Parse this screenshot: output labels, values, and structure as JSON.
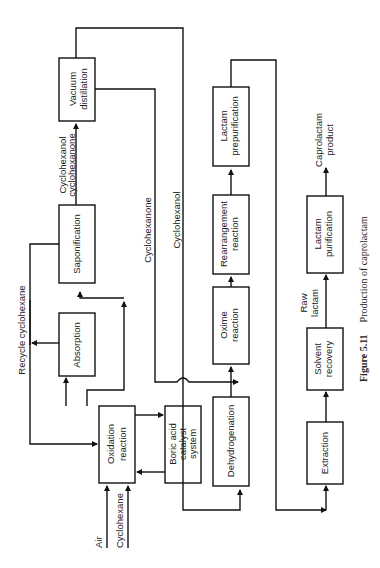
{
  "figure": {
    "number": "Figure 5.11",
    "caption": "Production of caprolactam",
    "orientation": "rotated 90° counter-clockwise"
  },
  "inputs": {
    "air": "Air",
    "cyclohexane": "Cyclohexane"
  },
  "blocks": {
    "oxidation": [
      "Oxidation",
      "reaction"
    ],
    "boric": [
      "Boric acid",
      "catalyst",
      "system"
    ],
    "absorption": [
      "Absorption"
    ],
    "saponification": [
      "Saponification"
    ],
    "vacuum": [
      "Vacuum",
      "distillation"
    ],
    "dehydrogenation": [
      "Dehydrogenation"
    ],
    "oxime": [
      "Oxime",
      "reaction"
    ],
    "rearrangement": [
      "Rearrangement",
      "reaction"
    ],
    "prepurification": [
      "Lactam",
      "prepurification"
    ],
    "extraction": [
      "Extraction"
    ],
    "solvent": [
      "Solvent",
      "recovery"
    ],
    "purification": [
      "Lactam",
      "purification"
    ]
  },
  "streams": {
    "recycle": "Recycle cyclohexane",
    "mix1": "Cyclohexanol",
    "mix2": "cyclohexanone",
    "cyclohexanone": "Cyclohexanone",
    "cyclohexanol": "Cyclohexanol",
    "raw1": "Raw",
    "raw2": "lactam",
    "product1": "Caprolactam",
    "product2": "product"
  }
}
